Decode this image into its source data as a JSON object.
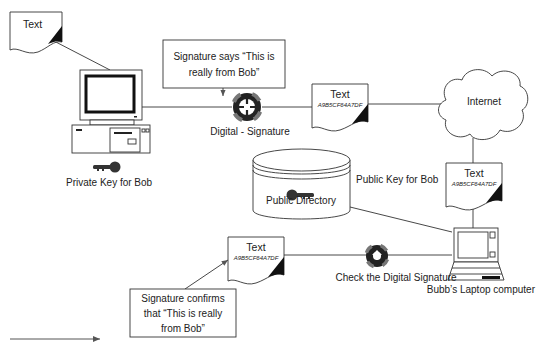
{
  "diagram": {
    "nodes": {
      "doc_origin": {
        "title": "Text"
      },
      "doc_signed": {
        "title": "Text",
        "hash": "A9B5CF64A7DF"
      },
      "doc_received": {
        "title": "Text",
        "hash": "A9B5CF64A7DF"
      },
      "doc_verified": {
        "title": "Text",
        "hash": "A9B5CF64A7DF"
      },
      "bob_pc": {
        "label": ""
      },
      "private_key": {
        "label": "Private Key for Bob"
      },
      "digital_signature": {
        "label": "Digital - Signature"
      },
      "signature_callout": {
        "line1": "Signature says “This is",
        "line2": "really from Bob”"
      },
      "internet": {
        "label": "Internet"
      },
      "public_directory": {
        "label": "Public Directory"
      },
      "public_key": {
        "label": "Public Key for Bob"
      },
      "laptop": {
        "label": "Bubb’s Laptop computer"
      },
      "check_signature": {
        "label": "Check the Digital Signature"
      },
      "confirm_callout": {
        "line1": "Signature confirms",
        "line2": "that  “This is really",
        "line3": "from Bob”"
      }
    },
    "edges": [
      {
        "from": "doc_origin",
        "to": "bob_pc"
      },
      {
        "from": "bob_pc",
        "to": "digital_signature"
      },
      {
        "from": "signature_callout",
        "to": "digital_signature",
        "arrow": true
      },
      {
        "from": "digital_signature",
        "to": "doc_signed"
      },
      {
        "from": "doc_signed",
        "to": "internet"
      },
      {
        "from": "internet",
        "to": "doc_received"
      },
      {
        "from": "doc_received",
        "to": "laptop"
      },
      {
        "from": "public_directory",
        "to": "laptop"
      },
      {
        "from": "laptop",
        "to": "check_signature"
      },
      {
        "from": "check_signature",
        "to": "doc_verified"
      },
      {
        "from": "confirm_callout",
        "to": "doc_verified",
        "arrow": true
      }
    ],
    "legend": {
      "arrow": "flow-arrow"
    },
    "colors": {
      "stroke": "#333333",
      "fill": "#ffffff",
      "dark": "#1a1a1a",
      "gray": "#888888"
    }
  }
}
